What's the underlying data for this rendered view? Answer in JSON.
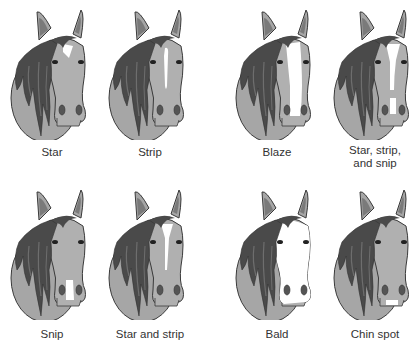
{
  "figure": {
    "colors": {
      "coat": "#a6a6a6",
      "coat_light": "#bdbdbd",
      "mane": "#4a4a4a",
      "mane_mid": "#6e6e6e",
      "outline": "#3a3a3a",
      "marking": "#ffffff",
      "ear_inner": "#7a7a7a",
      "nostril": "#555555",
      "background": "#ffffff",
      "text": "#333333"
    },
    "markings": [
      {
        "id": "star",
        "label": "Star",
        "row": 1,
        "col": 1
      },
      {
        "id": "strip",
        "label": "Strip",
        "row": 1,
        "col": 2
      },
      {
        "id": "blaze",
        "label": "Blaze",
        "row": 1,
        "col": 3
      },
      {
        "id": "star-strip-snip",
        "label": "Star, strip,",
        "label2": "and snip",
        "row": 1,
        "col": 4
      },
      {
        "id": "snip",
        "label": "Snip",
        "row": 2,
        "col": 1
      },
      {
        "id": "star-and-strip",
        "label": "Star and strip",
        "row": 2,
        "col": 2
      },
      {
        "id": "bald",
        "label": "Bald",
        "row": 2,
        "col": 3
      },
      {
        "id": "chin-spot",
        "label": "Chin spot",
        "row": 2,
        "col": 4
      }
    ]
  }
}
